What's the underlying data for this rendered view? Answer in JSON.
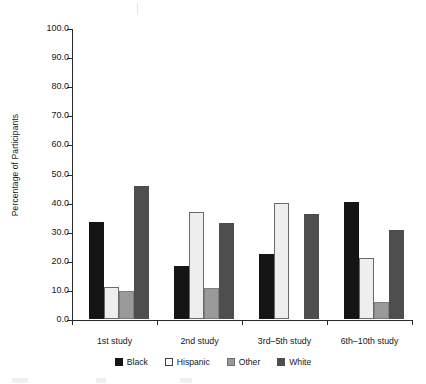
{
  "chart_data": {
    "type": "bar",
    "title": "",
    "subtitle": "",
    "xlabel": "",
    "ylabel": "Percentage of Participants",
    "ylim": [
      0,
      100
    ],
    "ytick_labels": [
      "0.0",
      "10.0",
      "20.0",
      "30.0",
      "40.0",
      "50.0",
      "60.0",
      "70.0",
      "80.0",
      "90.0",
      "100.0"
    ],
    "ytick_values": [
      0,
      10,
      20,
      30,
      40,
      50,
      60,
      70,
      80,
      90,
      100
    ],
    "grid": false,
    "legend_position": "bottom",
    "categories": [
      "1st study",
      "2nd study",
      "3rd–5th study",
      "6th–10th study"
    ],
    "series": [
      {
        "name": "Black",
        "color": "#151515",
        "values": [
          33.3,
          18.2,
          22.2,
          40.2
        ]
      },
      {
        "name": "Hispanic",
        "color": "#eeeeee",
        "values": [
          11.0,
          36.8,
          40.0,
          21.0
        ]
      },
      {
        "name": "Other",
        "color": "#9a9a9a",
        "values": [
          9.5,
          10.8,
          0.0,
          5.7
        ]
      },
      {
        "name": "White",
        "color": "#4e4e4e",
        "values": [
          45.7,
          33.0,
          36.2,
          30.5
        ]
      }
    ]
  },
  "axis": {
    "y_title": "Percentage of Participants"
  },
  "legend": {
    "items": [
      {
        "label": "Black"
      },
      {
        "label": "Hispanic"
      },
      {
        "label": "Other"
      },
      {
        "label": "White"
      }
    ]
  }
}
